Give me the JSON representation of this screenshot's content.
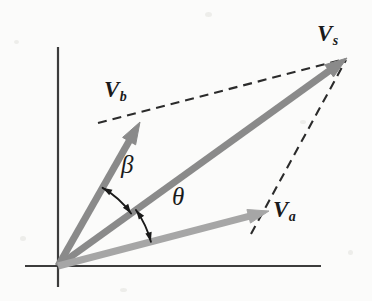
{
  "figure": {
    "type": "vector-diagram",
    "background_color": "#fbfbfa",
    "width": 372,
    "height": 301
  },
  "axes": {
    "origin": {
      "x": 58,
      "y": 266
    },
    "x_axis": {
      "x1": 25,
      "y1": 266,
      "x2": 321,
      "y2": 266
    },
    "y_axis": {
      "x1": 58,
      "y1": 47,
      "x2": 58,
      "y2": 287
    },
    "color": "#3c3c3c",
    "stroke_width": 2.2
  },
  "vectors": [
    {
      "id": "vs",
      "label_base": "V",
      "label_sub": "s",
      "color": "#8a8a8a",
      "from": {
        "x": 58,
        "y": 266
      },
      "to": {
        "x": 347,
        "y": 58
      },
      "stroke_width": 7,
      "head_length": 22,
      "head_width": 15,
      "label_pos": {
        "x": 317,
        "y": 22
      }
    },
    {
      "id": "vb",
      "label_base": "V",
      "label_sub": "b",
      "color": "#8a8a8a",
      "from": {
        "x": 58,
        "y": 266
      },
      "to": {
        "x": 140,
        "y": 122
      },
      "stroke_width": 7,
      "head_length": 22,
      "head_width": 15,
      "label_pos": {
        "x": 104,
        "y": 78
      }
    },
    {
      "id": "va",
      "label_base": "V",
      "label_sub": "a",
      "color": "#a6a6a6",
      "from": {
        "x": 58,
        "y": 266
      },
      "to": {
        "x": 269,
        "y": 211
      },
      "stroke_width": 7,
      "head_length": 21,
      "head_width": 14,
      "label_pos": {
        "x": 273,
        "y": 198
      }
    }
  ],
  "dashed_lines": [
    {
      "id": "vb-to-vs",
      "from": {
        "x": 98,
        "y": 123
      },
      "to": {
        "x": 345,
        "y": 59
      },
      "color": "#2b2b2b",
      "stroke_width": 2.1,
      "dash": "9 6"
    },
    {
      "id": "va-to-vs",
      "from": {
        "x": 251,
        "y": 234
      },
      "to": {
        "x": 346,
        "y": 60
      },
      "color": "#2b2b2b",
      "stroke_width": 2.1,
      "dash": "9 6"
    }
  ],
  "angles": [
    {
      "id": "beta",
      "symbol": "β",
      "between": [
        "vb",
        "vs"
      ],
      "radius": 90,
      "start_deg": 60.3,
      "end_deg": 35.7,
      "color": "#1a1a1a",
      "label_pos": {
        "x": 121,
        "y": 152
      }
    },
    {
      "id": "theta",
      "symbol": "θ",
      "between": [
        "vs",
        "va"
      ],
      "radius": 96,
      "start_deg": 35.7,
      "end_deg": 14.6,
      "color": "#1a1a1a",
      "label_pos": {
        "x": 172,
        "y": 184
      }
    }
  ]
}
